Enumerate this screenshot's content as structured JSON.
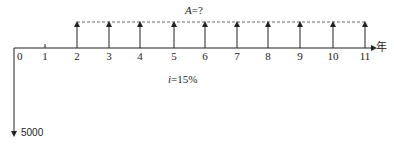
{
  "diagram": {
    "type": "cash-flow-diagram",
    "annuity_label": "A=?",
    "annuity_label_var": "A",
    "annuity_label_rest": "=?",
    "interest_label_var": "i",
    "interest_label_rest": "=15%",
    "axis_unit": "年",
    "initial_outflow": "5000",
    "periods": [
      "0",
      "1",
      "2",
      "3",
      "4",
      "5",
      "6",
      "7",
      "8",
      "9",
      "10",
      "11"
    ],
    "inflow_periods": [
      2,
      3,
      4,
      5,
      6,
      7,
      8,
      9,
      10,
      11
    ],
    "outflow_period": 0
  }
}
